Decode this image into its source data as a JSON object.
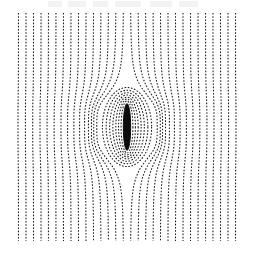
{
  "figure": {
    "title": "",
    "background_color": "#ffffff",
    "line_color": "#1a1a1a",
    "body_color": "#0d0d0d",
    "frame": {
      "x": 13,
      "y": 13,
      "width": 228,
      "height": 228
    }
  },
  "chart_data": {
    "type": "line",
    "subtitle": "",
    "xlabel": "",
    "ylabel": "",
    "xlim": [
      -1.0,
      1.0
    ],
    "ylim": [
      -1.0,
      1.0
    ],
    "grid": false,
    "legend_position": "none",
    "xticks": [],
    "yticks": [],
    "xtick_labels": [],
    "ytick_labels": [],
    "annotations": [],
    "style": {
      "stroke_style": "dotted-dashed",
      "dash_pattern": [
        1.6,
        1.6
      ],
      "line_width": 1.05,
      "stream_count": 30,
      "stream_orientation": "vertical",
      "closed_loop_count": 7
    },
    "body": {
      "name": "central-dipole-bar",
      "shape": "ellipse",
      "center_x": 0.0,
      "center_y": 0.0,
      "semi_width": 0.032,
      "semi_height": 0.205,
      "fill": "#0d0d0d"
    },
    "series": [
      {
        "name": "streamline-01",
        "x0": -0.952,
        "deflection": 0.004
      },
      {
        "name": "streamline-02",
        "x0": -0.886,
        "deflection": 0.005
      },
      {
        "name": "streamline-03",
        "x0": -0.82,
        "deflection": 0.007
      },
      {
        "name": "streamline-04",
        "x0": -0.754,
        "deflection": 0.009
      },
      {
        "name": "streamline-05",
        "x0": -0.689,
        "deflection": 0.012
      },
      {
        "name": "streamline-06",
        "x0": -0.623,
        "deflection": 0.016
      },
      {
        "name": "streamline-07",
        "x0": -0.557,
        "deflection": 0.022
      },
      {
        "name": "streamline-08",
        "x0": -0.491,
        "deflection": 0.03
      },
      {
        "name": "streamline-09",
        "x0": -0.425,
        "deflection": 0.041
      },
      {
        "name": "streamline-10",
        "x0": -0.359,
        "deflection": 0.057
      },
      {
        "name": "streamline-11",
        "x0": -0.293,
        "deflection": 0.079
      },
      {
        "name": "streamline-12",
        "x0": -0.228,
        "deflection": 0.11
      },
      {
        "name": "streamline-13",
        "x0": -0.162,
        "deflection": 0.15
      },
      {
        "name": "streamline-14",
        "x0": -0.096,
        "deflection": 0.196
      },
      {
        "name": "streamline-15",
        "x0": -0.03,
        "deflection": 0.235
      },
      {
        "name": "streamline-16",
        "x0": 0.03,
        "deflection": 0.235
      },
      {
        "name": "streamline-17",
        "x0": 0.096,
        "deflection": 0.196
      },
      {
        "name": "streamline-18",
        "x0": 0.162,
        "deflection": 0.15
      },
      {
        "name": "streamline-19",
        "x0": 0.228,
        "deflection": 0.11
      },
      {
        "name": "streamline-20",
        "x0": 0.293,
        "deflection": 0.079
      },
      {
        "name": "streamline-21",
        "x0": 0.359,
        "deflection": 0.057
      },
      {
        "name": "streamline-22",
        "x0": 0.425,
        "deflection": 0.041
      },
      {
        "name": "streamline-23",
        "x0": 0.491,
        "deflection": 0.03
      },
      {
        "name": "streamline-24",
        "x0": 0.557,
        "deflection": 0.022
      },
      {
        "name": "streamline-25",
        "x0": 0.623,
        "deflection": 0.016
      },
      {
        "name": "streamline-26",
        "x0": 0.689,
        "deflection": 0.012
      },
      {
        "name": "streamline-27",
        "x0": 0.754,
        "deflection": 0.009
      },
      {
        "name": "streamline-28",
        "x0": 0.82,
        "deflection": 0.007
      },
      {
        "name": "streamline-29",
        "x0": 0.886,
        "deflection": 0.005
      },
      {
        "name": "streamline-30",
        "x0": 0.952,
        "deflection": 0.004
      }
    ],
    "loops": [
      {
        "name": "loop-1",
        "rx": 0.052,
        "ry": 0.228
      },
      {
        "name": "loop-2",
        "rx": 0.074,
        "ry": 0.245
      },
      {
        "name": "loop-3",
        "rx": 0.098,
        "ry": 0.262
      },
      {
        "name": "loop-4",
        "rx": 0.124,
        "ry": 0.281
      },
      {
        "name": "loop-5",
        "rx": 0.152,
        "ry": 0.301
      },
      {
        "name": "loop-6",
        "rx": 0.183,
        "ry": 0.323
      },
      {
        "name": "loop-7",
        "rx": 0.216,
        "ry": 0.347
      }
    ]
  }
}
